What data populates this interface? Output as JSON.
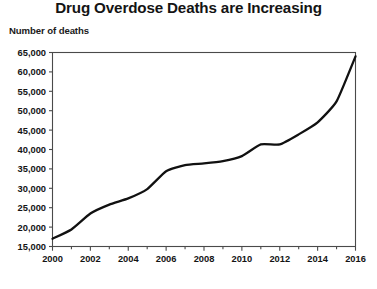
{
  "chart_data": {
    "type": "line",
    "title": "Drug Overdose Deaths are Increasing",
    "ylabel": "Number of deaths",
    "xlabel": "",
    "grid": false,
    "legend": false,
    "xlim": [
      2000,
      2016
    ],
    "ylim": [
      15000,
      65000
    ],
    "x": [
      2000,
      2001,
      2002,
      2003,
      2004,
      2005,
      2006,
      2007,
      2008,
      2009,
      2010,
      2011,
      2012,
      2013,
      2014,
      2015,
      2016
    ],
    "values": [
      17000,
      19400,
      23500,
      25800,
      27400,
      29800,
      34400,
      36000,
      36400,
      37000,
      38300,
      41300,
      41300,
      43900,
      47000,
      52400,
      64000
    ],
    "series": [
      {
        "name": "Drug overdose deaths",
        "values": [
          17000,
          19400,
          23500,
          25800,
          27400,
          29800,
          34400,
          36000,
          36400,
          37000,
          38300,
          41300,
          41300,
          43900,
          47000,
          52400,
          64000
        ]
      }
    ],
    "x_tick_labels": [
      "2000",
      "2002",
      "2004",
      "2006",
      "2008",
      "2010",
      "2012",
      "2014",
      "2016"
    ],
    "x_tick_values": [
      2000,
      2002,
      2004,
      2006,
      2008,
      2010,
      2012,
      2014,
      2016
    ],
    "x_minor_tick_values": [
      2001,
      2003,
      2005,
      2007,
      2009,
      2011,
      2013,
      2015
    ],
    "y_tick_labels": [
      "65,000",
      "60,000",
      "55,000",
      "50,000",
      "45,000",
      "40,000",
      "35,000",
      "30,000",
      "25,000",
      "20,000",
      "15,000"
    ],
    "y_tick_values": [
      65000,
      60000,
      55000,
      50000,
      45000,
      40000,
      35000,
      30000,
      25000,
      20000,
      15000
    ],
    "line_color": "#111111",
    "line_width": 2.3,
    "axis_color": "#4a4a4a",
    "background_color": "#ffffff"
  }
}
